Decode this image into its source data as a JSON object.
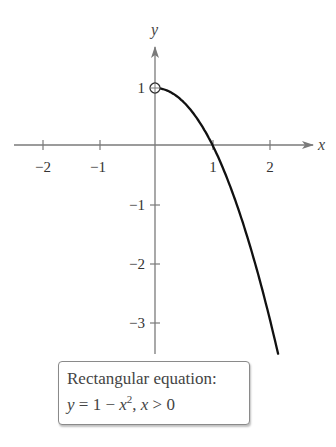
{
  "chart_data": {
    "type": "line",
    "title": "",
    "xlabel": "x",
    "ylabel": "y",
    "xlim": [
      -2.45,
      2.7
    ],
    "ylim": [
      -3.6,
      1.55
    ],
    "x_ticks": [
      -2,
      -1,
      1,
      2
    ],
    "x_tick_labels": [
      "−2",
      "−1",
      "1",
      "2"
    ],
    "y_ticks": [
      1,
      -1,
      -2,
      -3
    ],
    "y_tick_labels": [
      "1",
      "−1",
      "−2",
      "−3"
    ],
    "grid": false,
    "legend": null,
    "series": [
      {
        "name": "y = 1 - x^2, x > 0",
        "function": "1 - x^2",
        "domain": [
          0,
          2.14
        ],
        "x": [
          0,
          0.25,
          0.5,
          0.75,
          1.0,
          1.25,
          1.5,
          1.75,
          2.0,
          2.14
        ],
        "y": [
          1,
          0.9375,
          0.75,
          0.4375,
          0,
          -0.5625,
          -1.25,
          -2.0625,
          -3,
          -3.58
        ],
        "open_endpoint": [
          0,
          1
        ]
      }
    ],
    "annotations": [
      {
        "text": "Rectangular equation:",
        "line": 1
      },
      {
        "text": "y = 1 − x², x > 0",
        "line": 2
      }
    ]
  },
  "labels": {
    "x_axis": "x",
    "y_axis": "y",
    "x_ticks": [
      "−2",
      "−1",
      "1",
      "2"
    ],
    "y_ticks": [
      "1",
      "−1",
      "−2",
      "−3"
    ]
  },
  "equation_box": {
    "title": "Rectangular equation:",
    "y_var": "y",
    "eq_sign": " = 1 − ",
    "x_var": "x",
    "exponent": "2",
    "sep": ", ",
    "x_var2": "x",
    "condition": " > 0"
  },
  "colors": {
    "axis": "#7a7a7a",
    "curve": "#111111",
    "text": "#444444"
  }
}
